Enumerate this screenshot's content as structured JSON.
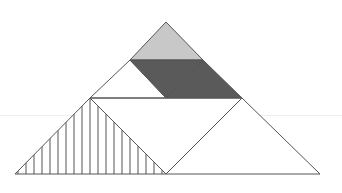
{
  "diagram": {
    "stroke_color": "#555555",
    "colors": {
      "light_gray": "#c8c8c8",
      "dark_gray": "#5a5a5a",
      "white": "#ffffff",
      "hatch": "#555555"
    },
    "shapes": [
      {
        "id": "top-small-triangle",
        "fill": "light_gray",
        "points": [
          [
            166,
            22
          ],
          [
            130,
            60
          ],
          [
            203,
            60
          ]
        ]
      },
      {
        "id": "dark-triangle-left",
        "fill": "dark_gray",
        "points": [
          [
            130,
            60
          ],
          [
            203,
            60
          ],
          [
            166,
            98
          ]
        ]
      },
      {
        "id": "dark-triangle-right",
        "fill": "dark_gray",
        "points": [
          [
            203,
            60
          ],
          [
            242,
            98
          ],
          [
            166,
            98
          ]
        ]
      },
      {
        "id": "white-small-triangle",
        "fill": "white",
        "points": [
          [
            130,
            60
          ],
          [
            90,
            98
          ],
          [
            166,
            98
          ]
        ]
      },
      {
        "id": "middle-parallelogram",
        "fill": "white",
        "points": [
          [
            90,
            98
          ],
          [
            242,
            98
          ],
          [
            166,
            174
          ]
        ]
      },
      {
        "id": "hatched-large-triangle",
        "fill": "hatch",
        "points": [
          [
            15,
            174
          ],
          [
            90,
            98
          ],
          [
            166,
            174
          ]
        ]
      },
      {
        "id": "right-large-triangle",
        "fill": "white",
        "points": [
          [
            166,
            174
          ],
          [
            242,
            98
          ],
          [
            320,
            174
          ]
        ]
      }
    ],
    "hatch_spacing": 8
  }
}
